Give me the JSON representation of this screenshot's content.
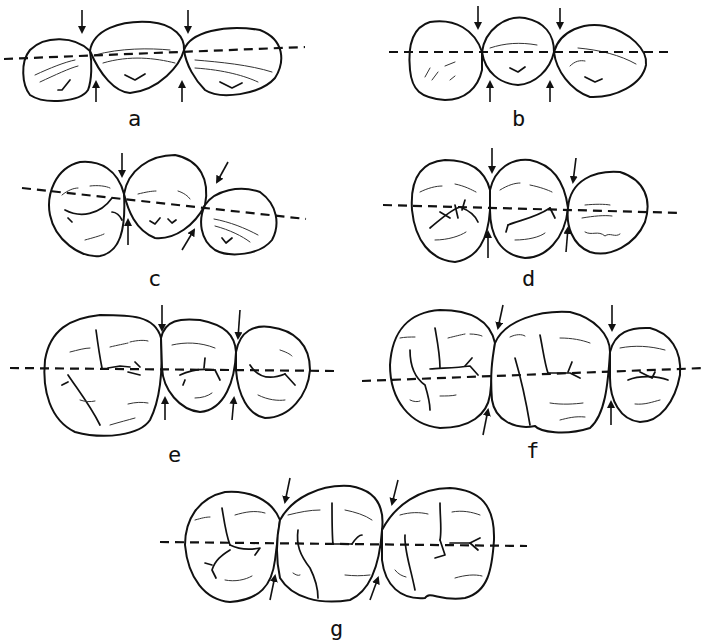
{
  "figure": {
    "colors": {
      "line": "#111111",
      "background": "#ffffff"
    },
    "panels": [
      {
        "id": "a",
        "label": "a",
        "arrows": "vertical, above and below two contacts"
      },
      {
        "id": "b",
        "label": "b",
        "arrows": "vertical, above and below two contacts"
      },
      {
        "id": "c",
        "label": "c",
        "arrows": "vertical at first contact, diagonal at second; line tilted down to right"
      },
      {
        "id": "d",
        "label": "d",
        "arrows": "vertical, above and below two contacts"
      },
      {
        "id": "e",
        "label": "e",
        "arrows": "vertical, above and below two contacts"
      },
      {
        "id": "f",
        "label": "f",
        "arrows": "diagonal at first contact, vertical at second"
      },
      {
        "id": "g",
        "label": "g",
        "arrows": "diagonal above and below two contacts"
      }
    ]
  }
}
